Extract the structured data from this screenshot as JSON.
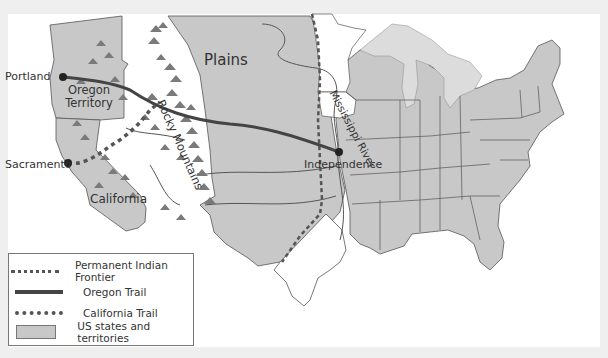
{
  "map": {
    "colors": {
      "background": "#efefef",
      "sea": "#ffffff",
      "states_fill": "#c8c8c8",
      "lakes": "#dadada",
      "borders": "#555555",
      "oregon_trail": "#444444",
      "california_trail": "#555555",
      "frontier": "#555555",
      "mountains": "#666666"
    },
    "labels": {
      "plains": "Plains",
      "portland": "Portland",
      "oregon_territory": "Oregon Territory",
      "sacramento": "Sacramento",
      "california": "California",
      "rocky_mountains": "Rocky Mountains",
      "independence": "Independence",
      "mississippi_river": "Mississippi River"
    },
    "points": [
      {
        "name": "Portland",
        "x": 63,
        "y": 77
      },
      {
        "name": "Sacramento",
        "x": 68,
        "y": 163
      },
      {
        "name": "Independence",
        "x": 339,
        "y": 152
      }
    ]
  },
  "legend": {
    "items": [
      {
        "symbol": "dotted-line",
        "label": "Permanent Indian Frontier"
      },
      {
        "symbol": "solid-line",
        "label": "Oregon Trail"
      },
      {
        "symbol": "heavy-dotted-line",
        "label": "California Trail"
      },
      {
        "symbol": "gray-swatch",
        "label": "US states and territories"
      }
    ]
  }
}
